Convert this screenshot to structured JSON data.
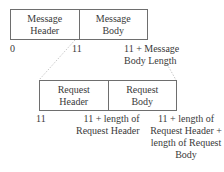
{
  "diagram": {
    "message_box": {
      "cells": [
        "Message\nHeader",
        "Message\nBody"
      ]
    },
    "message_offsets": [
      "0",
      "11",
      "11 + Message\nBody Length"
    ],
    "request_box": {
      "cells": [
        "Request\nHeader",
        "Request\nBody"
      ]
    },
    "request_offsets": [
      "11",
      "11 + length of\nRequest Header",
      "11 + length of\nRequest Header +\nlength of Request\nBody"
    ],
    "colors": {
      "line": "#6e6e6e",
      "dotted": "#b0b0b0",
      "text": "#3a3a3a"
    }
  }
}
